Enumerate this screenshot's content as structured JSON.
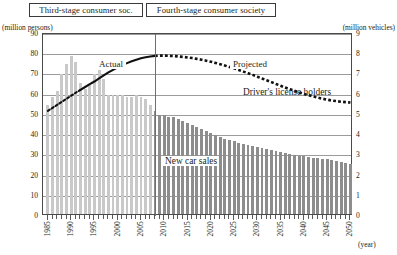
{
  "header": {
    "third_stage_label": "Third-stage consumer soc.",
    "fourth_stage_label": "Fourth-stage consumer society"
  },
  "axes": {
    "left_unit": "(million persons)",
    "right_unit": "(million vehicles)",
    "x_unit": "(year)"
  },
  "annotations": {
    "actual": "Actual",
    "projected": "Projected",
    "license_series": "Driver's license holders",
    "newcar_series": "New car sales"
  },
  "chart_data": {
    "type": "bar",
    "title": "",
    "subtitle": "",
    "xlabel": "(year)",
    "ylabel": "(million persons)",
    "y2label": "(million vehicles)",
    "ylim": [
      0,
      90
    ],
    "y2lim": [
      0,
      9
    ],
    "xlim": [
      1985,
      2050
    ],
    "grid": true,
    "legend_position": "inline-annotations",
    "divider_year": 2008,
    "y_ticks": [
      0,
      10,
      20,
      30,
      40,
      50,
      60,
      70,
      80,
      90
    ],
    "y2_ticks": [
      0,
      1,
      2,
      3,
      4,
      5,
      6,
      7,
      8,
      9
    ],
    "x_tick_labels": [
      "1985",
      "1990",
      "1995",
      "2000",
      "2005",
      "2010",
      "2015",
      "2020",
      "2025",
      "2030",
      "2035",
      "2040",
      "2045",
      "2050"
    ],
    "x_tick_label_years": [
      1985,
      1990,
      1995,
      2000,
      2005,
      2010,
      2015,
      2020,
      2025,
      2030,
      2035,
      2040,
      2045,
      2050
    ],
    "x": [
      1985,
      1986,
      1987,
      1988,
      1989,
      1990,
      1991,
      1992,
      1993,
      1994,
      1995,
      1996,
      1997,
      1998,
      1999,
      2000,
      2001,
      2002,
      2003,
      2004,
      2005,
      2006,
      2007,
      2008,
      2009,
      2010,
      2011,
      2012,
      2013,
      2014,
      2015,
      2016,
      2017,
      2018,
      2019,
      2020,
      2021,
      2022,
      2023,
      2024,
      2025,
      2026,
      2027,
      2028,
      2029,
      2030,
      2031,
      2032,
      2033,
      2034,
      2035,
      2036,
      2037,
      2038,
      2039,
      2040,
      2041,
      2042,
      2043,
      2044,
      2045,
      2046,
      2047,
      2048,
      2049,
      2050
    ],
    "series": [
      {
        "name": "New car sales",
        "type": "bar",
        "axis": "right",
        "unit": "million vehicles",
        "values": [
          5.4,
          5.8,
          6.1,
          6.9,
          7.4,
          7.8,
          7.5,
          6.5,
          6.2,
          6.4,
          6.9,
          7.1,
          6.7,
          5.9,
          5.9,
          5.9,
          5.9,
          5.8,
          5.8,
          5.9,
          5.8,
          5.7,
          5.4,
          5.1,
          4.9,
          4.9,
          4.8,
          4.8,
          4.7,
          4.6,
          4.5,
          4.4,
          4.3,
          4.2,
          4.1,
          4.0,
          3.9,
          3.8,
          3.7,
          3.65,
          3.6,
          3.5,
          3.45,
          3.4,
          3.35,
          3.3,
          3.25,
          3.2,
          3.15,
          3.1,
          3.05,
          3.0,
          2.95,
          2.9,
          2.88,
          2.85,
          2.82,
          2.78,
          2.75,
          2.72,
          2.7,
          2.65,
          2.6,
          2.55,
          2.5,
          2.45
        ],
        "color_actual": "#c9c9c9",
        "color_projected": "#8d8d8d"
      },
      {
        "name": "Driver's license holders",
        "type": "line",
        "axis": "left",
        "unit": "million persons",
        "style_actual": "dotted-then-solid",
        "style_projected": "dotted",
        "color": "#111111",
        "values": [
          52.0,
          53.5,
          55.0,
          56.5,
          58.0,
          59.5,
          61.0,
          62.4,
          63.8,
          65.2,
          66.5,
          68.0,
          69.5,
          71.0,
          72.3,
          73.5,
          74.6,
          75.6,
          76.5,
          77.3,
          78.0,
          78.5,
          78.9,
          79.2,
          79.3,
          79.3,
          79.2,
          79.1,
          78.9,
          78.7,
          78.4,
          78.1,
          77.7,
          77.3,
          76.8,
          76.3,
          75.7,
          75.1,
          74.4,
          73.7,
          73.0,
          72.2,
          71.4,
          70.6,
          69.8,
          68.9,
          68.0,
          67.1,
          66.2,
          65.3,
          64.4,
          63.5,
          62.7,
          61.9,
          61.1,
          60.4,
          59.7,
          59.1,
          58.5,
          58.0,
          57.5,
          57.1,
          56.8,
          56.5,
          56.3,
          56.1
        ]
      }
    ]
  }
}
